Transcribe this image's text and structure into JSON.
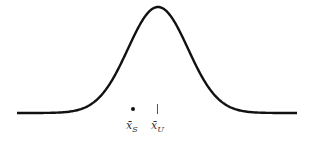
{
  "diagram": {
    "type": "normal-distribution-curve",
    "curve_color": "#111111",
    "markers": [
      {
        "name": "sample-mean",
        "symbol": "dot",
        "label_base": "x̄",
        "label_sub": "S"
      },
      {
        "name": "population-mean",
        "symbol": "tick",
        "label_base": "x̄",
        "label_sub": "U"
      }
    ]
  }
}
